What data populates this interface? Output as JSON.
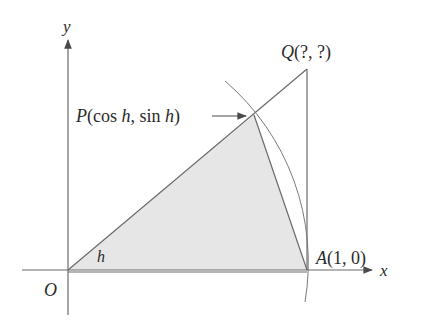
{
  "diagram": {
    "axes": {
      "x_label": "x",
      "y_label": "y",
      "origin_label": "O"
    },
    "angle_label": "h",
    "points": {
      "P": {
        "name": "P",
        "coords_text": "(cos h, sin h)",
        "cos_word": "cos",
        "sin_word": "sin",
        "var": "h"
      },
      "Q": {
        "name": "Q",
        "coords_text": "(?, ?)"
      },
      "A": {
        "name": "A",
        "coords_text": "(1, 0)"
      }
    },
    "colors": {
      "line": "#6a6a6a",
      "fill": "#e4e4e4",
      "text": "#2a2a2a"
    }
  }
}
